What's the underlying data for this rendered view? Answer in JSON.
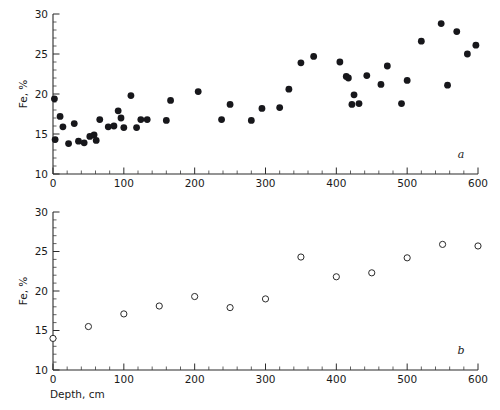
{
  "figure": {
    "background": "#ffffff",
    "marker_color_filled": "#17171b",
    "marker_color_open_stroke": "#2a2a2a"
  },
  "chart_data": [
    {
      "type": "scatter",
      "panel_label": "a",
      "title": "",
      "xlabel": "",
      "ylabel": "Fe, %",
      "xlim": [
        0,
        600
      ],
      "ylim": [
        10,
        30
      ],
      "xticks": [
        0,
        100,
        200,
        300,
        400,
        500,
        600
      ],
      "xticklabels": [
        "0",
        "100",
        "200",
        "300",
        "400",
        "500",
        "600"
      ],
      "yticks": [
        10,
        15,
        20,
        25,
        30
      ],
      "yticklabels": [
        "10",
        "15",
        "20",
        "25",
        "30"
      ],
      "minor_tick_step_x": 20,
      "minor_tick_step_y": 1,
      "grid": false,
      "legend": null,
      "marker": "filled-circle",
      "x": [
        2,
        3,
        10,
        14,
        22,
        30,
        36,
        44,
        52,
        58,
        61,
        66,
        78,
        86,
        92,
        96,
        100,
        110,
        118,
        124,
        133,
        160,
        166,
        205,
        238,
        250,
        280,
        295,
        320,
        333,
        350,
        368,
        405,
        414,
        417,
        422,
        425,
        432,
        443,
        463,
        472,
        492,
        500,
        520,
        548,
        557,
        570,
        585,
        597
      ],
      "y": [
        19.4,
        14.3,
        17.2,
        15.9,
        13.8,
        16.3,
        14.1,
        13.9,
        14.7,
        14.9,
        14.2,
        16.8,
        15.9,
        16.0,
        17.9,
        17.0,
        15.8,
        19.8,
        15.8,
        16.8,
        16.8,
        16.7,
        19.2,
        20.3,
        16.8,
        18.7,
        16.7,
        18.2,
        18.3,
        20.6,
        23.9,
        24.7,
        24.0,
        22.2,
        22.0,
        18.7,
        19.9,
        18.8,
        22.3,
        21.2,
        23.5,
        18.8,
        21.7,
        26.6,
        28.8,
        21.1,
        27.8,
        25.0,
        26.1
      ]
    },
    {
      "type": "scatter",
      "panel_label": "b",
      "title": "",
      "xlabel": "Depth, cm",
      "ylabel": "Fe, %",
      "xlim": [
        0,
        600
      ],
      "ylim": [
        10,
        30
      ],
      "xticks": [
        0,
        100,
        200,
        300,
        400,
        500,
        600
      ],
      "xticklabels": [
        "0",
        "100",
        "200",
        "300",
        "400",
        "500",
        "600"
      ],
      "yticks": [
        10,
        15,
        20,
        25,
        30
      ],
      "yticklabels": [
        "10",
        "15",
        "20",
        "25",
        "30"
      ],
      "minor_tick_step_x": 20,
      "minor_tick_step_y": 1,
      "grid": false,
      "legend": null,
      "marker": "open-circle",
      "x": [
        0,
        50,
        100,
        150,
        200,
        250,
        300,
        350,
        400,
        450,
        500,
        550,
        600
      ],
      "y": [
        14.0,
        15.5,
        17.1,
        18.1,
        19.3,
        17.9,
        19.0,
        24.3,
        21.8,
        22.3,
        24.2,
        25.9,
        25.7
      ]
    }
  ]
}
